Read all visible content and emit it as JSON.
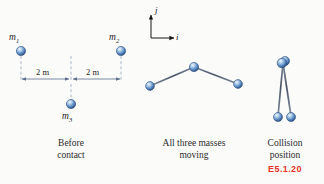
{
  "figure": {
    "background_color": "#fbfbfa",
    "accent_color": "#e8332a",
    "ball_color": "#4a7fc1",
    "line_color": "#3b3b4a",
    "dim_color": "#6b7f9e"
  },
  "axes": {
    "vertical_label": "j",
    "horizontal_label": "i"
  },
  "panels": [
    {
      "id": "before-contact",
      "caption": "Before\ncontact",
      "masses": [
        {
          "label_base": "m",
          "label_sub": "1",
          "x": 21,
          "y": 51
        },
        {
          "label_base": "m",
          "label_sub": "2",
          "x": 121,
          "y": 51
        },
        {
          "label_base": "m",
          "label_sub": "3",
          "x": 71,
          "y": 110
        }
      ],
      "dimensions": [
        {
          "text": "2 m",
          "x": 46,
          "y": 74
        },
        {
          "text": "2 m",
          "x": 96,
          "y": 74
        }
      ]
    },
    {
      "id": "all-three-masses-moving",
      "caption": "All three masses\nmoving",
      "masses": [
        {
          "x": 150,
          "y": 86
        },
        {
          "x": 194,
          "y": 67
        },
        {
          "x": 238,
          "y": 84
        }
      ]
    },
    {
      "id": "collision-position",
      "caption": "Collision\nposition",
      "tag": "E5.1.20",
      "masses": [
        {
          "x": 283,
          "y": 63
        },
        {
          "x": 278,
          "y": 116
        },
        {
          "x": 291,
          "y": 116
        }
      ]
    }
  ]
}
